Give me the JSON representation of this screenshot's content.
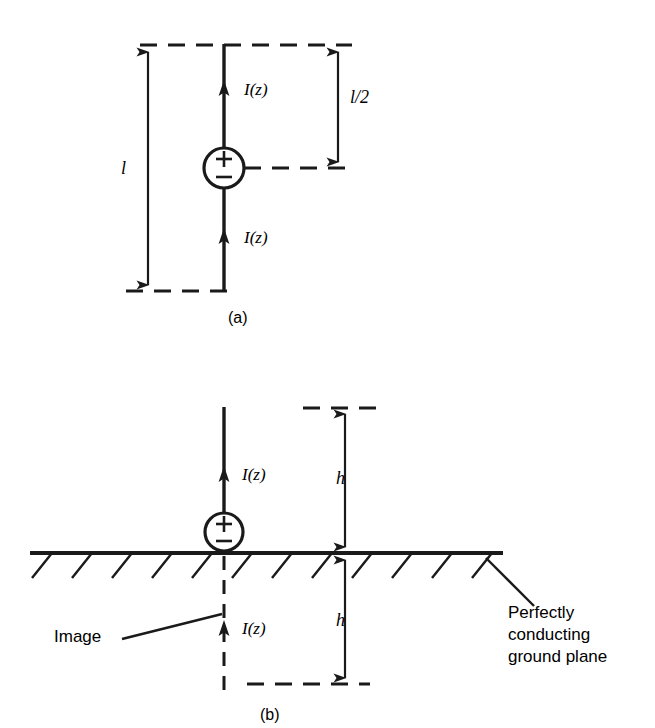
{
  "figure": {
    "caption_a": "(a)",
    "caption_b": "(b)",
    "panels": [
      {
        "id": "a",
        "caption": "(a)",
        "description": "Center-fed dipole antenna of total length l driven by a source",
        "labels": {
          "current_upper": "I(z)",
          "current_lower": "I(z)",
          "total_length": "l",
          "half_length": "l/2"
        },
        "source_symbol": {
          "plus": "+",
          "minus": "−"
        }
      },
      {
        "id": "b",
        "caption": "(b)",
        "description": "Monopole of height h over a perfectly conducting ground plane with its image",
        "labels": {
          "current_upper": "I(z)",
          "current_image": "I(z)",
          "height_above": "h",
          "height_below": "h",
          "image_label": "Image",
          "ground_plane_note": "Perfectly\nconducting\nground plane"
        },
        "source_symbol": {
          "plus": "+",
          "minus": "−"
        }
      }
    ],
    "colors": {
      "ink": "#1a1a1a",
      "background": "#ffffff"
    }
  }
}
